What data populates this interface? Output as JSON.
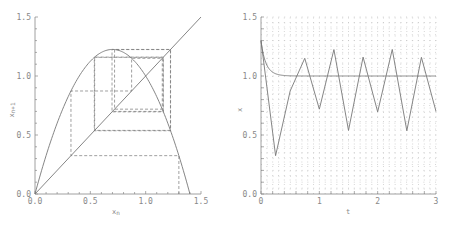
{
  "chart_data": [
    {
      "type": "line",
      "title": "",
      "subtype": "cobweb",
      "xlabel": "x_n",
      "ylabel": "x_n+1",
      "xlim": [
        0,
        1.5
      ],
      "ylim": [
        0,
        1.5
      ],
      "xticks": [
        "0.0",
        "0.5",
        "1.0",
        "1.5"
      ],
      "yticks": [
        "0.0",
        "0.5",
        "1.0",
        "1.5"
      ],
      "grid": false,
      "series": [
        {
          "name": "map f(x) = x(1 + 2.5(1 - x))",
          "style": "solid",
          "x": [
            0,
            0.1,
            0.2,
            0.3,
            0.4,
            0.5,
            0.6,
            0.7,
            0.8,
            0.9,
            1.0,
            1.1,
            1.2,
            1.3,
            1.4
          ],
          "y": [
            0,
            0.325,
            0.6,
            0.825,
            1.0,
            1.125,
            1.2,
            1.225,
            1.2,
            1.125,
            1.0,
            0.825,
            0.6,
            0.325,
            0
          ]
        },
        {
          "name": "diagonal x_n+1 = x_n",
          "style": "solid",
          "x": [
            0,
            1.5
          ],
          "y": [
            0,
            1.5
          ]
        },
        {
          "name": "cobweb iterations",
          "style": "dashed",
          "iterates": [
            1.3,
            0.325,
            0.873,
            1.15,
            0.719,
            1.224,
            0.539,
            1.16,
            0.696,
            1.225,
            0.536,
            1.158,
            0.7
          ]
        }
      ]
    },
    {
      "type": "line",
      "title": "",
      "xlabel": "t",
      "ylabel": "x",
      "xlim": [
        0,
        3
      ],
      "ylim": [
        0,
        1.5
      ],
      "xticks": [
        "0",
        "1",
        "2",
        "3"
      ],
      "yticks": [
        "0.0",
        "0.5",
        "1.0",
        "1.5"
      ],
      "grid": true,
      "grid_style": "dotted",
      "series": [
        {
          "name": "discrete iterates",
          "style": "solid",
          "x": [
            0,
            0.25,
            0.5,
            0.75,
            1.0,
            1.25,
            1.5,
            1.75,
            2.0,
            2.25,
            2.5,
            2.75,
            3.0
          ],
          "y": [
            1.3,
            0.325,
            0.873,
            1.15,
            0.719,
            1.224,
            0.539,
            1.16,
            0.696,
            1.225,
            0.536,
            1.158,
            0.7
          ]
        },
        {
          "name": "continuous solution",
          "style": "solid",
          "x": [
            0,
            0.05,
            0.1,
            0.15,
            0.2,
            0.3,
            0.4,
            0.5,
            0.7,
            1.0,
            2.0,
            3.0
          ],
          "y": [
            1.3,
            1.16,
            1.09,
            1.05,
            1.03,
            1.01,
            1.004,
            1.001,
            1.0,
            1.0,
            1.0,
            1.0
          ]
        }
      ]
    }
  ],
  "left": {
    "xlabel": "x",
    "xlabel_sub": "n",
    "ylabel": "x",
    "ylabel_sub": "n+1",
    "xticks": [
      "0.0",
      "0.5",
      "1.0",
      "1.5"
    ],
    "yticks": [
      "0.0",
      "0.5",
      "1.0",
      "1.5"
    ]
  },
  "right": {
    "xlabel": "t",
    "ylabel": "x",
    "xticks": [
      "0",
      "1",
      "2",
      "3"
    ],
    "yticks": [
      "0.0",
      "0.5",
      "1.0",
      "1.5"
    ]
  },
  "colors": {
    "axis": "#888888",
    "line": "#777777",
    "grid": "#bbbbbb"
  }
}
